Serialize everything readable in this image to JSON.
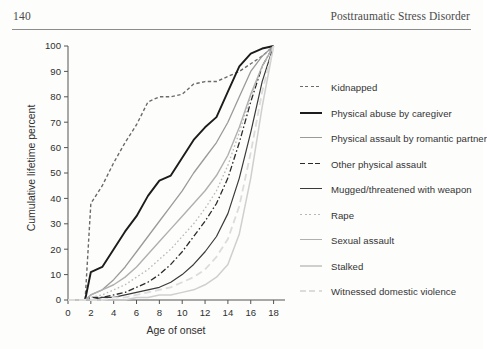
{
  "running_head": {
    "page_number": "140",
    "book_title": "Posttraumatic Stress Disorder"
  },
  "chart_data": {
    "type": "line",
    "title": "",
    "subtitle": "",
    "xlabel": "Age of onset",
    "ylabel": "Cumulative lifetime percent",
    "xlim": [
      0,
      19
    ],
    "ylim": [
      0,
      100
    ],
    "xticks": [
      "0",
      "2",
      "4",
      "6",
      "8",
      "10",
      "12",
      "14",
      "16",
      "18"
    ],
    "xtick_values": [
      0,
      2,
      4,
      6,
      8,
      10,
      12,
      14,
      16,
      18
    ],
    "yticks": [
      "0",
      "10",
      "20",
      "30",
      "40",
      "50",
      "60",
      "70",
      "80",
      "90",
      "100"
    ],
    "ytick_values": [
      0,
      10,
      20,
      30,
      40,
      50,
      60,
      70,
      80,
      90,
      100
    ],
    "grid": false,
    "legend_position": "right",
    "x": [
      0,
      1,
      1.5,
      2,
      3,
      4,
      5,
      6,
      7,
      8,
      9,
      10,
      11,
      12,
      13,
      14,
      15,
      16,
      17,
      18
    ],
    "series": [
      {
        "name": "Kidnapped",
        "color": "#6b6b6b",
        "style": "dashed",
        "width": 1.4,
        "values": [
          0,
          0,
          0,
          38,
          45,
          54,
          62,
          69,
          78,
          80,
          80,
          81,
          85,
          86,
          86,
          88,
          90,
          93,
          96,
          100
        ]
      },
      {
        "name": "Physical abuse by caregiver",
        "color": "#1c1c1c",
        "style": "solid",
        "width": 1.9,
        "values": [
          0,
          0,
          0,
          11,
          13,
          20,
          27,
          33,
          41,
          47,
          49,
          56,
          63,
          68,
          72,
          82,
          92,
          97,
          99,
          100
        ]
      },
      {
        "name": "Physical assault by romantic partner",
        "color": "#9a9a9a",
        "style": "solid",
        "width": 1.3,
        "values": [
          0,
          0,
          0,
          2,
          4,
          8,
          13,
          19,
          25,
          31,
          37,
          43,
          50,
          56,
          62,
          70,
          80,
          90,
          96,
          100
        ]
      },
      {
        "name": "Other physical assault",
        "color": "#2a2a2a",
        "style": "dashdot",
        "width": 1.3,
        "values": [
          0,
          0,
          0,
          1,
          1,
          2,
          3,
          5,
          7,
          10,
          14,
          19,
          25,
          31,
          38,
          48,
          62,
          78,
          92,
          100
        ]
      },
      {
        "name": "Mugged/threatened with weapon",
        "color": "#3a3a3a",
        "style": "solid",
        "width": 1.2,
        "values": [
          0,
          0,
          0,
          0,
          1,
          1,
          2,
          3,
          4,
          5,
          7,
          10,
          14,
          19,
          25,
          34,
          48,
          66,
          86,
          100
        ]
      },
      {
        "name": "Rape",
        "color": "#b8b8b8",
        "style": "dotted",
        "width": 1.3,
        "values": [
          0,
          0,
          0,
          1,
          2,
          4,
          6,
          9,
          12,
          16,
          20,
          25,
          30,
          36,
          43,
          53,
          66,
          80,
          92,
          100
        ]
      },
      {
        "name": "Sexual assault",
        "color": "#b0b0b0",
        "style": "solid",
        "width": 1.4,
        "values": [
          0,
          0,
          0,
          2,
          4,
          6,
          9,
          13,
          18,
          23,
          28,
          33,
          38,
          43,
          49,
          57,
          68,
          81,
          92,
          100
        ]
      },
      {
        "name": "Stalked",
        "color": "#cfcfcf",
        "style": "solid",
        "width": 1.5,
        "values": [
          0,
          0,
          0,
          0,
          0,
          0,
          0,
          1,
          1,
          2,
          2,
          3,
          4,
          6,
          9,
          14,
          26,
          48,
          76,
          100
        ]
      },
      {
        "name": "Witnessed domestic violence",
        "color": "#dcdcdc",
        "style": "dashed",
        "width": 1.8,
        "values": [
          0,
          0,
          0,
          0,
          0,
          1,
          1,
          2,
          3,
          4,
          5,
          7,
          9,
          12,
          17,
          24,
          37,
          58,
          82,
          100
        ]
      }
    ]
  }
}
